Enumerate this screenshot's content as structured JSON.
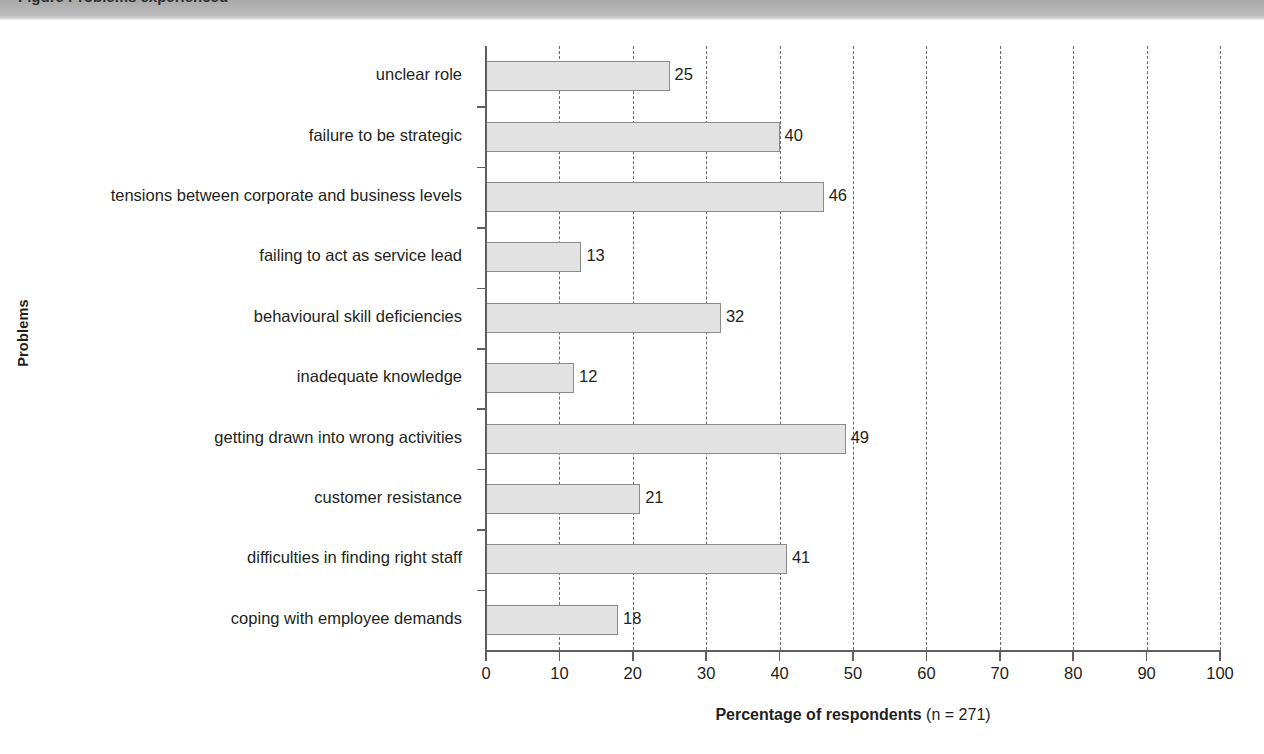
{
  "caption": {
    "text": "Figure  Problems experienced"
  },
  "chart_data": {
    "type": "bar",
    "orientation": "horizontal",
    "title": "",
    "xlabel": "Percentage of respondents (n = 271)",
    "xlabel_bold_part": "Percentage of respondents",
    "xlabel_note_part": " (n = 271)",
    "ylabel": "Problems",
    "xlim": [
      0,
      100
    ],
    "xticks": [
      0,
      10,
      20,
      30,
      40,
      50,
      60,
      70,
      80,
      90,
      100
    ],
    "xticklabels": [
      "0",
      "10",
      "20",
      "30",
      "40",
      "50",
      "60",
      "70",
      "80",
      "90",
      "100"
    ],
    "grid": "vertical-dashed",
    "legend": "none",
    "n": 271,
    "categories": [
      "unclear role",
      "failure to be strategic",
      "tensions between corporate and business levels",
      "failing to act as service lead",
      "behavioural skill deficiencies",
      "inadequate knowledge",
      "getting drawn into wrong activities",
      "customer resistance",
      "difficulties in finding right staff",
      "coping with employee demands"
    ],
    "values": [
      25,
      40,
      46,
      13,
      32,
      12,
      49,
      21,
      41,
      18
    ],
    "bar_fill_color": "#e2e2e2",
    "bar_edge_color": "#8a8a8a",
    "axis_color": "#5f5f5f",
    "text_color": "#231f20"
  }
}
